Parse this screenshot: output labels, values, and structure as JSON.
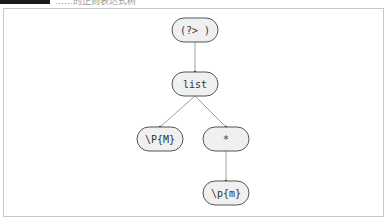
{
  "header": {
    "caption": "……的正则表达式树",
    "dark_block": true
  },
  "diagram": {
    "type": "regex-syntax-tree",
    "nodes": [
      {
        "id": "n0",
        "label": "(?> )",
        "cx": 195,
        "cy": 30
      },
      {
        "id": "n1",
        "label": "list",
        "cx": 195,
        "cy": 84
      },
      {
        "id": "n2",
        "label": "\\P{M}",
        "cx": 160,
        "cy": 139
      },
      {
        "id": "n3",
        "label": "*",
        "cx": 226,
        "cy": 139
      },
      {
        "id": "n4",
        "label": "\\p{m}",
        "cx": 226,
        "cy": 193
      }
    ],
    "edges": [
      {
        "from": "n0",
        "to": "n1"
      },
      {
        "from": "n1",
        "to": "n2"
      },
      {
        "from": "n1",
        "to": "n3"
      },
      {
        "from": "n3",
        "to": "n4"
      }
    ],
    "colors": {
      "node_fill": "#f0f0f0",
      "node_stroke": "#555555",
      "edge": "#888888",
      "text": "#333333"
    }
  }
}
